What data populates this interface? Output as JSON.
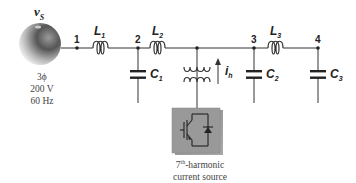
{
  "source": {
    "label_main": "v",
    "label_sub": "S",
    "spec_lines": [
      "3ϕ",
      "200 V",
      "60 Hz"
    ]
  },
  "nodes": [
    {
      "id": "1",
      "label": "1"
    },
    {
      "id": "2",
      "label": "2"
    },
    {
      "id": "3",
      "label": "3"
    },
    {
      "id": "4",
      "label": "4"
    }
  ],
  "inductors": [
    {
      "id": "L1",
      "main": "L",
      "sub": "1"
    },
    {
      "id": "L2",
      "main": "L",
      "sub": "2"
    },
    {
      "id": "L3",
      "main": "L",
      "sub": "3"
    }
  ],
  "capacitors": [
    {
      "id": "C1",
      "main": "C",
      "sub": "1"
    },
    {
      "id": "C2",
      "main": "C",
      "sub": "2"
    },
    {
      "id": "C3",
      "main": "C",
      "sub": "3"
    }
  ],
  "harmonic_source": {
    "current_main": "i",
    "current_sub": "h",
    "caption_line1_num": "7",
    "caption_line1_sup": "th",
    "caption_line1_rest": "-harmonic",
    "caption_line2": "current source"
  }
}
